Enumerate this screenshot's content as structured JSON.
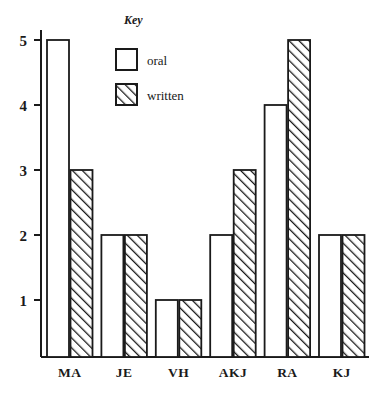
{
  "chart_data": {
    "type": "bar",
    "title": "",
    "xlabel": "",
    "ylabel": "",
    "categories": [
      "MA",
      "JE",
      "VH",
      "AKJ",
      "RA",
      "KJ"
    ],
    "series": [
      {
        "name": "oral",
        "values": [
          5,
          2,
          1,
          2,
          4,
          2
        ]
      },
      {
        "name": "written",
        "values": [
          3,
          2,
          1,
          3,
          5,
          2
        ]
      }
    ],
    "ytick_labels": [
      "1",
      "2",
      "3",
      "4",
      "5"
    ],
    "ytick_values": [
      1,
      2,
      3,
      4,
      5
    ],
    "ylim": [
      0,
      5.3
    ],
    "grid": false,
    "legend_position": "top-center",
    "legend_title": "Key",
    "legend_entries": [
      {
        "label": "oral",
        "pattern": "solid-white"
      },
      {
        "label": "written",
        "pattern": "diagonal-hatch"
      }
    ],
    "colors": {
      "ink": "#1a1a1a",
      "background": "#ffffff",
      "oral_fill": "#ffffff",
      "written_fill": "#ffffff",
      "hatch_stroke": "#1a1a1a"
    }
  }
}
